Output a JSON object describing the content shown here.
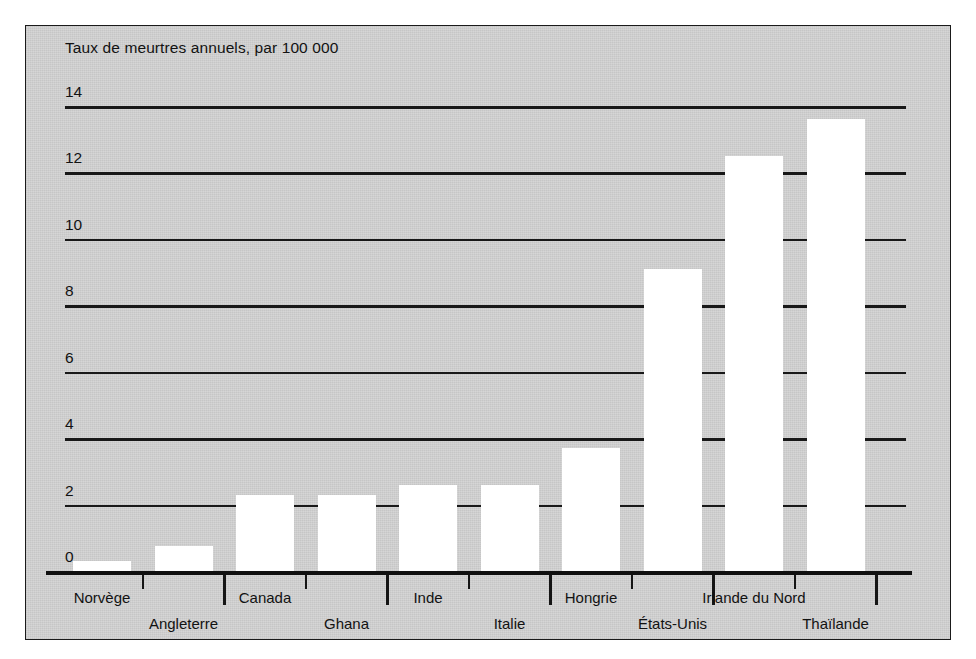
{
  "figure": {
    "background_color": "#d4d4d4",
    "border_color": "#1a1a1a",
    "bar_color": "#ffffff",
    "ink_color": "#121212"
  },
  "chart_data": {
    "type": "bar",
    "title": "Taux de meurtres annuels, par 100 000",
    "xlabel": "",
    "ylabel": "",
    "ylim": [
      0,
      14
    ],
    "yticks": [
      0,
      2,
      4,
      6,
      8,
      10,
      12,
      14
    ],
    "ytick_labels": [
      "0",
      "2",
      "4",
      "6",
      "8",
      "10",
      "12",
      "14"
    ],
    "grid": true,
    "legend": false,
    "categories": [
      "Norvège",
      "Angleterre",
      "Canada",
      "Ghana",
      "Inde",
      "Italie",
      "Hongrie",
      "États-Unis",
      "Irlande du Nord",
      "Thaïlande"
    ],
    "values": [
      0.3,
      0.75,
      2.3,
      2.3,
      2.6,
      2.6,
      3.7,
      9.1,
      12.5,
      13.6
    ],
    "label_rows": [
      0,
      1,
      0,
      1,
      0,
      1,
      0,
      1,
      0,
      1
    ]
  }
}
